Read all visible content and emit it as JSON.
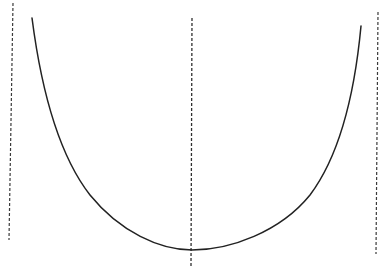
{
  "diagram": {
    "type": "curve-with-axes",
    "background": "#ffffff",
    "ink_color": "#2a2a2a",
    "dashed_color": "#3a3a3a",
    "curve": {
      "shape": "U-curve",
      "start": [
        32,
        18
      ],
      "minimum": [
        192,
        250
      ],
      "end": [
        361,
        26
      ]
    },
    "vertical_lines": [
      {
        "name": "left-boundary",
        "x1": 13,
        "y1": 3,
        "x2": 9,
        "y2": 240
      },
      {
        "name": "center-axis",
        "x1": 192,
        "y1": 18,
        "x2": 191,
        "y2": 266
      },
      {
        "name": "right-boundary",
        "x1": 378,
        "y1": 12,
        "x2": 376,
        "y2": 254
      }
    ]
  }
}
